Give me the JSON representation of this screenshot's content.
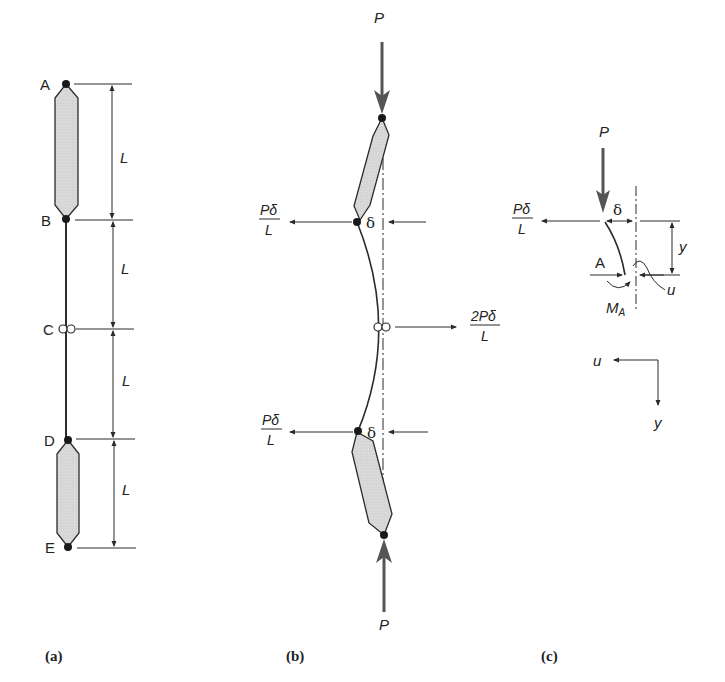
{
  "figure": {
    "panel_a": {
      "caption": "(a)",
      "nodes": [
        "A",
        "B",
        "C",
        "D",
        "E"
      ],
      "segment_labels": [
        "L",
        "L",
        "L",
        "L"
      ]
    },
    "panel_b": {
      "caption": "(b)",
      "load_top": "P",
      "load_bottom": "P",
      "reaction_top": {
        "num": "Pδ",
        "den": "L"
      },
      "reaction_bottom": {
        "num": "Pδ",
        "den": "L"
      },
      "reaction_mid": {
        "num": "2Pδ",
        "den": "L"
      },
      "delta_top": "δ",
      "delta_bottom": "δ"
    },
    "panel_c": {
      "caption": "(c)",
      "load": "P",
      "reaction": {
        "num": "Pδ",
        "den": "L"
      },
      "delta": "δ",
      "y_label": "y",
      "axial_label": "A",
      "u_label": "u",
      "moment_label": "M",
      "moment_sub": "A",
      "axes": {
        "u": "u",
        "y": "y"
      }
    }
  },
  "colors": {
    "line": "#2b2b2b",
    "fill": "#d9d9d9",
    "load_arrow": "#555555"
  }
}
